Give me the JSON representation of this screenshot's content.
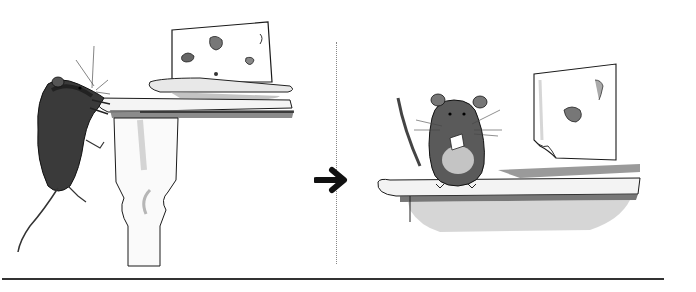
{
  "figure": {
    "panels": [
      {
        "id": "before",
        "caption": ""
      },
      {
        "id": "after",
        "caption": ""
      }
    ],
    "transition_icon": "arrow-right-icon",
    "colors": {
      "ink": "#1a1a1a",
      "wash_dark": "#555555",
      "wash_mid": "#8a8a8a",
      "wash_light": "#c8c8c8",
      "background": "#ffffff"
    }
  }
}
